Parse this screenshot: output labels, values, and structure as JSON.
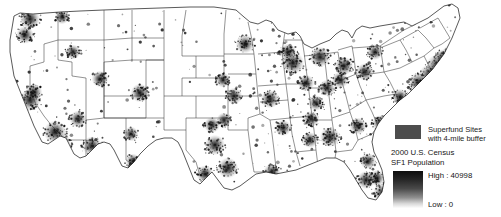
{
  "figure": {
    "type": "choropleth-dot-map",
    "region": "Continental United States",
    "background_color": "#ffffff",
    "state_outline_color": "#3a3a3a"
  },
  "legend": {
    "superfund": {
      "swatch_color": "#4d4d4d",
      "line1": "Superfund Sites",
      "line2": "with 4-mile buffer"
    },
    "census": {
      "line1": "2000 U.S. Census",
      "line2": "SF1 Population"
    },
    "ramp": {
      "high_label": "High : 40998",
      "low_label": "Low : 0",
      "high_color": "#0d0d0d",
      "low_color": "#fdfdfd"
    }
  },
  "chart_data": {
    "type": "heatmap",
    "title": "",
    "xlabel": "",
    "ylabel": "",
    "legend_position": "bottom-right",
    "grid": false,
    "variable": "2000 U.S. Census SF1 Population",
    "value_range": [
      0,
      40998
    ],
    "overlay": "Superfund Sites with 4-mile buffer",
    "colorscale": [
      "#fdfdfd",
      "#0d0d0d"
    ],
    "density_clusters": [
      {
        "name": "New York / Newark",
        "x": 438,
        "y": 66,
        "intensity": 1.0
      },
      {
        "name": "Philadelphia",
        "x": 430,
        "y": 75,
        "intensity": 0.9
      },
      {
        "name": "Boston",
        "x": 452,
        "y": 55,
        "intensity": 0.88
      },
      {
        "name": "Washington / Baltimore",
        "x": 419,
        "y": 83,
        "intensity": 0.86
      },
      {
        "name": "Los Angeles",
        "x": 55,
        "y": 132,
        "intensity": 0.95
      },
      {
        "name": "San Francisco Bay",
        "x": 30,
        "y": 100,
        "intensity": 0.88
      },
      {
        "name": "Chicago",
        "x": 293,
        "y": 63,
        "intensity": 0.92
      },
      {
        "name": "Detroit",
        "x": 320,
        "y": 57,
        "intensity": 0.82
      },
      {
        "name": "Houston",
        "x": 228,
        "y": 168,
        "intensity": 0.82
      },
      {
        "name": "Dallas / Fort Worth",
        "x": 215,
        "y": 145,
        "intensity": 0.8
      },
      {
        "name": "Atlanta",
        "x": 330,
        "y": 137,
        "intensity": 0.8
      },
      {
        "name": "Miami",
        "x": 383,
        "y": 193,
        "intensity": 0.78
      },
      {
        "name": "Phoenix",
        "x": 92,
        "y": 146,
        "intensity": 0.76
      },
      {
        "name": "Seattle",
        "x": 30,
        "y": 19,
        "intensity": 0.8
      },
      {
        "name": "Denver",
        "x": 140,
        "y": 93,
        "intensity": 0.72
      },
      {
        "name": "Minneapolis",
        "x": 245,
        "y": 44,
        "intensity": 0.72
      },
      {
        "name": "St. Louis",
        "x": 270,
        "y": 99,
        "intensity": 0.7
      },
      {
        "name": "Cleveland",
        "x": 344,
        "y": 66,
        "intensity": 0.7
      },
      {
        "name": "Pittsburgh",
        "x": 365,
        "y": 72,
        "intensity": 0.66
      },
      {
        "name": "Tampa",
        "x": 366,
        "y": 180,
        "intensity": 0.68
      },
      {
        "name": "San Diego",
        "x": 62,
        "y": 143,
        "intensity": 0.7
      },
      {
        "name": "Las Vegas",
        "x": 78,
        "y": 119,
        "intensity": 0.62
      },
      {
        "name": "Salt Lake City",
        "x": 100,
        "y": 79,
        "intensity": 0.6
      },
      {
        "name": "Portland",
        "x": 25,
        "y": 35,
        "intensity": 0.66
      },
      {
        "name": "Charlotte",
        "x": 358,
        "y": 126,
        "intensity": 0.62
      },
      {
        "name": "New Orleans",
        "x": 272,
        "y": 172,
        "intensity": 0.62
      },
      {
        "name": "Kansas City",
        "x": 234,
        "y": 96,
        "intensity": 0.6
      },
      {
        "name": "Nashville",
        "x": 311,
        "y": 119,
        "intensity": 0.58
      },
      {
        "name": "Cincinnati",
        "x": 327,
        "y": 88,
        "intensity": 0.6
      },
      {
        "name": "Indianapolis",
        "x": 306,
        "y": 83,
        "intensity": 0.6
      },
      {
        "name": "Milwaukee",
        "x": 288,
        "y": 52,
        "intensity": 0.62
      },
      {
        "name": "Columbus",
        "x": 340,
        "y": 80,
        "intensity": 0.6
      },
      {
        "name": "San Antonio",
        "x": 205,
        "y": 174,
        "intensity": 0.64
      },
      {
        "name": "Oklahoma City",
        "x": 212,
        "y": 125,
        "intensity": 0.56
      },
      {
        "name": "Memphis",
        "x": 283,
        "y": 128,
        "intensity": 0.58
      },
      {
        "name": "Birmingham",
        "x": 310,
        "y": 140,
        "intensity": 0.56
      },
      {
        "name": "Richmond",
        "x": 400,
        "y": 97,
        "intensity": 0.58
      },
      {
        "name": "Buffalo",
        "x": 375,
        "y": 52,
        "intensity": 0.56
      },
      {
        "name": "Hartford",
        "x": 443,
        "y": 58,
        "intensity": 0.66
      },
      {
        "name": "Sacramento",
        "x": 34,
        "y": 92,
        "intensity": 0.6
      },
      {
        "name": "Albuquerque",
        "x": 131,
        "y": 134,
        "intensity": 0.5
      },
      {
        "name": "Boise",
        "x": 73,
        "y": 52,
        "intensity": 0.5
      },
      {
        "name": "Omaha",
        "x": 223,
        "y": 80,
        "intensity": 0.5
      },
      {
        "name": "Jacksonville",
        "x": 368,
        "y": 161,
        "intensity": 0.56
      },
      {
        "name": "Orlando",
        "x": 377,
        "y": 178,
        "intensity": 0.58
      },
      {
        "name": "Raleigh",
        "x": 380,
        "y": 123,
        "intensity": 0.56
      },
      {
        "name": "Louisville",
        "x": 316,
        "y": 103,
        "intensity": 0.54
      },
      {
        "name": "Tulsa",
        "x": 224,
        "y": 120,
        "intensity": 0.5
      },
      {
        "name": "Spokane",
        "x": 62,
        "y": 17,
        "intensity": 0.48
      },
      {
        "name": "El Paso",
        "x": 133,
        "y": 161,
        "intensity": 0.5
      }
    ]
  }
}
